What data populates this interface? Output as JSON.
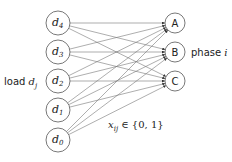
{
  "diagram": {
    "load_nodes": [
      {
        "id": "d4",
        "base": "d",
        "sub": "4",
        "cx": 58,
        "cy": 23
      },
      {
        "id": "d3",
        "base": "d",
        "sub": "3",
        "cx": 58,
        "cy": 52
      },
      {
        "id": "d2",
        "base": "d",
        "sub": "2",
        "cx": 58,
        "cy": 81
      },
      {
        "id": "d1",
        "base": "d",
        "sub": "1",
        "cx": 58,
        "cy": 110
      },
      {
        "id": "d0",
        "base": "d",
        "sub": "0",
        "cx": 58,
        "cy": 140
      }
    ],
    "phase_nodes": [
      {
        "id": "A",
        "label": "A",
        "cx": 175,
        "cy": 23
      },
      {
        "id": "B",
        "label": "B",
        "cx": 175,
        "cy": 52
      },
      {
        "id": "C",
        "label": "C",
        "cx": 175,
        "cy": 81
      }
    ],
    "load_label": {
      "text": "load ",
      "var": "d",
      "sub": "j"
    },
    "phase_label": {
      "text": "phase ",
      "var": "i"
    },
    "edge_label": {
      "var": "x",
      "sub": "ij",
      "rest": " ∈ {0, 1}"
    },
    "edges": "complete bipartite: every load node d0..d4 connects to each phase node A, B, C with an arrow",
    "colors": {
      "stroke": "#555555",
      "edge": "#777777",
      "text": "#222222"
    }
  }
}
